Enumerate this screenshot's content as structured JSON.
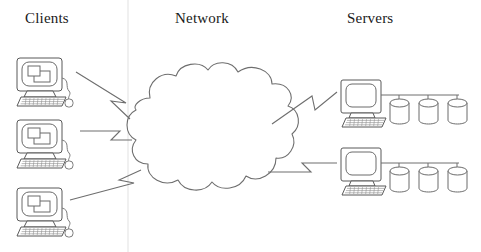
{
  "diagram": {
    "background_color": "#ffffff",
    "stroke_color": "#555555",
    "text_color": "#1a1a1a",
    "width": 481,
    "height": 252
  },
  "headings": {
    "clients": "Clients",
    "network": "Network",
    "servers": "Servers"
  },
  "divider": {
    "name": "vertical-divider",
    "x": 128,
    "color": "#e2e2e2"
  },
  "clients": [
    {
      "id": "client-1",
      "label": "Clients",
      "x": 15,
      "y": 58
    },
    {
      "id": "client-2",
      "label": "Clients",
      "x": 15,
      "y": 120
    },
    {
      "id": "client-3",
      "label": "Clients",
      "x": 15,
      "y": 188
    }
  ],
  "cloud": {
    "name": "network-cloud",
    "label": "Network",
    "cx": 210,
    "cy": 130
  },
  "servers": [
    {
      "id": "server-1",
      "label": "Servers",
      "x": 341,
      "y": 80,
      "disks": 3
    },
    {
      "id": "server-2",
      "label": "Servers",
      "x": 341,
      "y": 148,
      "disks": 3
    }
  ],
  "arrows": [
    {
      "id": "arrow-client-1-to-cloud",
      "from": "client-1",
      "to": "network-cloud",
      "direction": "right-down"
    },
    {
      "id": "arrow-client-2-to-cloud",
      "from": "client-2",
      "to": "network-cloud",
      "direction": "right"
    },
    {
      "id": "arrow-client-3-to-cloud",
      "from": "client-3",
      "to": "network-cloud",
      "direction": "right-up"
    },
    {
      "id": "arrow-cloud-to-server-1",
      "from": "network-cloud",
      "to": "server-1",
      "direction": "right-up"
    },
    {
      "id": "arrow-cloud-to-server-2",
      "from": "network-cloud",
      "to": "server-2",
      "direction": "right-down"
    }
  ]
}
